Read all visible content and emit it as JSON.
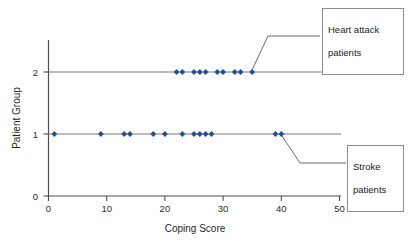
{
  "chart_data": {
    "type": "scatter",
    "title": "",
    "xlabel": "Coping Score",
    "ylabel": "Patient Group",
    "xlim": [
      0,
      50
    ],
    "ylim": [
      0,
      2.35
    ],
    "xticks": [
      0,
      10,
      20,
      30,
      40,
      50
    ],
    "yticks": [
      0,
      1,
      2
    ],
    "grid": false,
    "legend_position": "callout-boxes",
    "series": [
      {
        "name": "Stroke patients",
        "group_value": 1,
        "x": [
          1,
          9,
          13,
          14,
          18,
          20,
          23,
          25,
          26,
          27,
          28,
          39,
          40
        ],
        "y": [
          1,
          1,
          1,
          1,
          1,
          1,
          1,
          1,
          1,
          1,
          1,
          1,
          1
        ]
      },
      {
        "name": "Heart attack patients",
        "group_value": 2,
        "x": [
          22,
          23,
          25,
          26,
          27,
          29,
          30,
          32,
          33,
          35
        ],
        "y": [
          2,
          2,
          2,
          2,
          2,
          2,
          2,
          2,
          2,
          2
        ]
      }
    ],
    "marker_color": "#1f4e9c",
    "annotations": [
      {
        "name": "heart-attack-callout",
        "text": "Heart attack\npatients",
        "points_to_x": 35,
        "points_to_y": 2
      },
      {
        "name": "stroke-callout",
        "text": "Stroke\npatients",
        "points_to_x": 40,
        "points_to_y": 1
      }
    ]
  },
  "axes": {
    "x_title": "Coping Score",
    "y_title": "Patient Group",
    "x_tick_labels": [
      "0",
      "10",
      "20",
      "30",
      "40",
      "50"
    ],
    "y_tick_labels": [
      "0",
      "1",
      "2"
    ]
  },
  "callouts": {
    "heart_attack": {
      "line1": "Heart attack",
      "line2": "patients"
    },
    "stroke": {
      "line1": "Stroke",
      "line2": "patients"
    }
  },
  "watermark": {
    "text": ""
  },
  "colors": {
    "marker": "#1f4e9c",
    "axis": "#4d4d4d",
    "group_line": "#7a7a7a",
    "callout_border": "#8c8c8c"
  }
}
